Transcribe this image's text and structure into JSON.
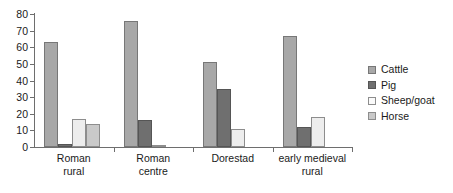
{
  "chart_data": {
    "type": "bar",
    "title": "",
    "subtitle": "",
    "xlabel": "",
    "ylabel": "",
    "ylim": [
      0,
      80
    ],
    "ytick_step": 10,
    "yticks": [
      "80",
      "70",
      "60",
      "50",
      "40",
      "30",
      "20",
      "10",
      "0"
    ],
    "grid": false,
    "legend_position": "right",
    "categories": [
      "Roman rural",
      "Roman centre",
      "Dorestad",
      "early medieval rural"
    ],
    "category_lines": [
      [
        "Roman",
        "rural"
      ],
      [
        "Roman",
        "centre"
      ],
      [
        "Dorestad",
        ""
      ],
      [
        "early medieval",
        "rural"
      ]
    ],
    "series": [
      {
        "name": "Cattle",
        "color": "#a8a8a8",
        "values": [
          63,
          76,
          51,
          67
        ]
      },
      {
        "name": "Pig",
        "color": "#6f6f6f",
        "values": [
          2,
          16,
          35,
          12
        ]
      },
      {
        "name": "Sheep/goat",
        "color": "#ededed",
        "values": [
          17,
          1,
          11,
          18
        ]
      },
      {
        "name": "Horse",
        "color": "#c9c9c9",
        "values": [
          14,
          0,
          0,
          0
        ]
      }
    ]
  },
  "legend": {
    "items": [
      {
        "label": "Cattle"
      },
      {
        "label": "Pig"
      },
      {
        "label": "Sheep/goat"
      },
      {
        "label": "Horse"
      }
    ]
  },
  "axis": {
    "line_color": "#6e6e6e"
  }
}
